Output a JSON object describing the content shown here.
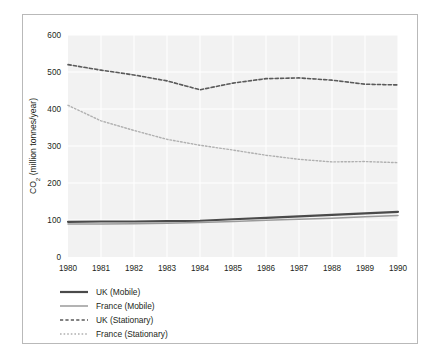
{
  "figure": {
    "frame_color": "#b9b9b9",
    "plot_background": "#f2f2f2",
    "gridline_color": "#ffffff"
  },
  "axes": {
    "y_title_main": "CO",
    "y_title_sub": "2",
    "y_title_rest": " (million tonnes/year)",
    "y_ticks": [
      "0",
      "100",
      "200",
      "300",
      "400",
      "500",
      "600"
    ],
    "x_ticks": [
      "1980",
      "1981",
      "1982",
      "1983",
      "1984",
      "1985",
      "1986",
      "1987",
      "1988",
      "1989",
      "1990"
    ]
  },
  "legend": {
    "items": [
      {
        "label": "UK (Mobile)",
        "style": "solid",
        "color": "#4a4a4a",
        "width": 2.2
      },
      {
        "label": "France (Mobile)",
        "style": "solid",
        "color": "#9a9a9a",
        "width": 1.5
      },
      {
        "label": "UK (Stationary)",
        "style": "dashed",
        "color": "#5a5a5a",
        "width": 1.5
      },
      {
        "label": "France (Stationary)",
        "style": "dotted",
        "color": "#b0b0b0",
        "width": 1.3
      }
    ]
  },
  "chart_data": {
    "type": "line",
    "title": "",
    "xlabel": "",
    "ylabel": "CO2 (million tonnes/year)",
    "x": [
      1980,
      1981,
      1982,
      1983,
      1984,
      1985,
      1986,
      1987,
      1988,
      1989,
      1990
    ],
    "xlim": [
      1980,
      1990
    ],
    "ylim": [
      0,
      600
    ],
    "grid": true,
    "legend_position": "below-left",
    "series": [
      {
        "name": "UK (Mobile)",
        "style": "solid",
        "color": "#4a4a4a",
        "values": [
          95,
          96,
          96,
          97,
          98,
          102,
          106,
          110,
          114,
          118,
          122
        ]
      },
      {
        "name": "France (Mobile)",
        "style": "solid",
        "color": "#9a9a9a",
        "values": [
          89,
          89,
          90,
          91,
          93,
          96,
          99,
          102,
          105,
          109,
          112
        ]
      },
      {
        "name": "UK (Stationary)",
        "style": "dashed",
        "color": "#5a5a5a",
        "values": [
          520,
          505,
          492,
          476,
          452,
          470,
          482,
          484,
          478,
          467,
          465
        ]
      },
      {
        "name": "France (Stationary)",
        "style": "dotted",
        "color": "#b0b0b0",
        "values": [
          410,
          368,
          342,
          318,
          302,
          289,
          275,
          264,
          257,
          258,
          255
        ]
      }
    ]
  }
}
